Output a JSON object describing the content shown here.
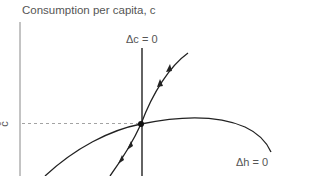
{
  "diagram": {
    "type": "phase-diagram",
    "y_axis_title": "Consumption per capita, c",
    "steady_state_c_label": "c̄",
    "loci": [
      {
        "name": "dc-zero",
        "label": "Δc = 0",
        "shape": "vertical line"
      },
      {
        "name": "dh-zero",
        "label": "Δh = 0",
        "shape": "hump-shaped curve"
      }
    ],
    "saddle_path": {
      "arrows": 4,
      "direction": "toward steady state"
    },
    "steady_state_point": "intersection of Δc = 0 and Δh = 0",
    "colors": {
      "line": "#222222",
      "axis": "#888888",
      "dashed": "#999999",
      "text": "#555555"
    }
  }
}
